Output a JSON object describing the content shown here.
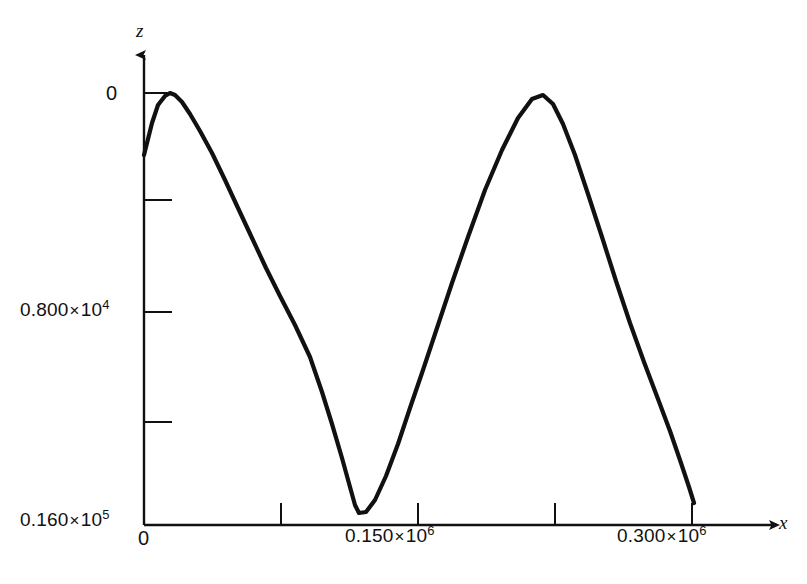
{
  "figure": {
    "background_color": "#ffffff",
    "line_color": "#111111",
    "axis_color": "#111111"
  },
  "axes": {
    "x_axis_name": "x",
    "y_axis_name": "z",
    "origin_label": "0"
  },
  "y_ticks": [
    {
      "label_mantissa": "0",
      "label_mult": "",
      "label_exp": "",
      "pixel_y": 93,
      "value": 0
    },
    {
      "label_mantissa": "",
      "label_mult": "",
      "label_exp": "",
      "pixel_y": 200,
      "value": 4000
    },
    {
      "label_mantissa": "0.800",
      "label_mult": "×",
      "label_exp": "4",
      "pixel_y": 312,
      "value": 8000
    },
    {
      "label_mantissa": "",
      "label_mult": "",
      "label_exp": "",
      "pixel_y": 422,
      "value": 12000
    },
    {
      "label_mantissa": "0.160",
      "label_mult": "×",
      "label_exp": "5",
      "pixel_y": 525,
      "value": 16000
    }
  ],
  "x_ticks": [
    {
      "label_mantissa": "0",
      "label_mult": "",
      "label_exp": "",
      "pixel_x": 144,
      "value": 0
    },
    {
      "label_mantissa": "",
      "label_mult": "",
      "label_exp": "",
      "pixel_x": 281,
      "value": 50000
    },
    {
      "label_mantissa": "0.150",
      "label_mult": "×",
      "label_exp": "6",
      "pixel_x": 418,
      "value": 150000
    },
    {
      "label_mantissa": "",
      "label_mult": "",
      "label_exp": "",
      "pixel_x": 555,
      "value": 200000
    },
    {
      "label_mantissa": "0.300",
      "label_mult": "×",
      "label_exp": "6",
      "pixel_x": 692,
      "value": 300000
    }
  ],
  "chart_data": {
    "type": "line",
    "title": "",
    "subtitle": "",
    "xlabel": "x",
    "ylabel": "z",
    "grid": false,
    "legend": null,
    "y_axis_inverted": true,
    "xlim": [
      0,
      305000
    ],
    "ylim": [
      0,
      16000
    ],
    "x_tick_labels": [
      "0",
      "",
      "0.150 × 10⁶",
      "",
      "0.300 × 10⁶"
    ],
    "y_tick_labels": [
      "0",
      "",
      "0.800 × 10⁴",
      "",
      "0.160 × 10⁵"
    ],
    "x_tick_values": [
      0,
      50000,
      150000,
      200000,
      300000
    ],
    "y_tick_values": [
      0,
      4000,
      8000,
      12000,
      16000
    ],
    "annotations": [
      {
        "text": "first peak",
        "x": 9500,
        "z": 0
      },
      {
        "text": "valley minimum",
        "x": 77000,
        "z": 15400
      },
      {
        "text": "second peak",
        "x": 145500,
        "z": 100
      }
    ],
    "series": [
      {
        "name": "z(x)",
        "color": "#111111",
        "x": [
          0,
          2000,
          4500,
          7000,
          9500,
          12000,
          15000,
          19000,
          24000,
          30000,
          37000,
          44000,
          52000,
          60000,
          68000,
          77000,
          86000,
          95000,
          104000,
          113000,
          121000,
          128000,
          134000,
          139000,
          143000,
          145500,
          148500,
          152000,
          157000,
          163000,
          171000,
          180000,
          190000,
          200000
        ],
        "values": [
          8900,
          5400,
          2100,
          500,
          0,
          400,
          1400,
          3200,
          5600,
          8100,
          10600,
          12400,
          13900,
          14900,
          15300,
          15400,
          15200,
          14500,
          13200,
          11300,
          9000,
          6700,
          4300,
          2000,
          400,
          100,
          500,
          1800,
          4100,
          6500,
          9100,
          11300,
          13000,
          14200
        ]
      }
    ],
    "curve_pixel_points": [
      [
        144,
        155
      ],
      [
        152,
        123
      ],
      [
        158,
        105
      ],
      [
        165,
        96
      ],
      [
        170,
        93
      ],
      [
        175,
        95
      ],
      [
        182,
        102
      ],
      [
        190,
        114
      ],
      [
        200,
        131
      ],
      [
        212,
        153
      ],
      [
        225,
        180
      ],
      [
        238,
        208
      ],
      [
        252,
        238
      ],
      [
        266,
        268
      ],
      [
        280,
        296
      ],
      [
        295,
        325
      ],
      [
        310,
        357
      ],
      [
        322,
        392
      ],
      [
        332,
        424
      ],
      [
        342,
        458
      ],
      [
        350,
        487
      ],
      [
        355,
        505
      ],
      [
        359,
        513
      ],
      [
        366,
        512
      ],
      [
        375,
        500
      ],
      [
        386,
        476
      ],
      [
        398,
        444
      ],
      [
        410,
        408
      ],
      [
        423,
        370
      ],
      [
        437,
        328
      ],
      [
        452,
        283
      ],
      [
        468,
        237
      ],
      [
        485,
        190
      ],
      [
        502,
        150
      ],
      [
        518,
        118
      ],
      [
        532,
        99
      ],
      [
        543,
        95
      ],
      [
        553,
        104
      ],
      [
        563,
        124
      ],
      [
        575,
        155
      ],
      [
        588,
        194
      ],
      [
        602,
        237
      ],
      [
        616,
        281
      ],
      [
        630,
        323
      ],
      [
        644,
        362
      ],
      [
        658,
        399
      ],
      [
        670,
        431
      ],
      [
        681,
        463
      ],
      [
        689,
        487
      ],
      [
        694,
        503
      ]
    ]
  }
}
